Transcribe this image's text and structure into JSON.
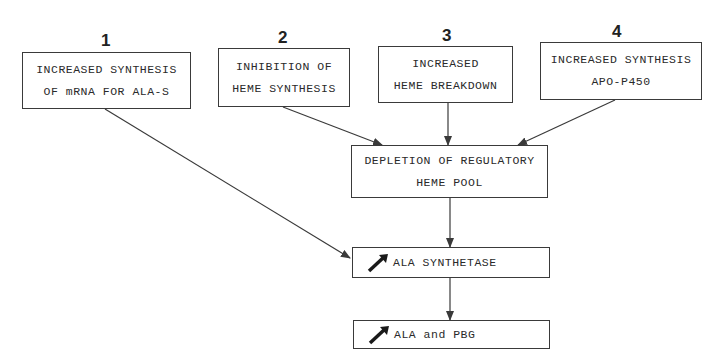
{
  "diagram": {
    "causes": [
      {
        "number": "1",
        "lines": [
          "INCREASED SYNTHESIS",
          "OF mRNA FOR ALA-S"
        ]
      },
      {
        "number": "2",
        "lines": [
          "INHIBITION OF",
          "HEME SYNTHESIS"
        ]
      },
      {
        "number": "3",
        "lines": [
          "INCREASED",
          "HEME BREAKDOWN"
        ]
      },
      {
        "number": "4",
        "lines": [
          "INCREASED SYNTHESIS",
          "APO-P450"
        ]
      }
    ],
    "depletion": {
      "lines": [
        "DEPLETION OF REGULATORY",
        "HEME POOL"
      ]
    },
    "ala_synthetase": {
      "icon": "increase-arrow-icon",
      "label": "ALA SYNTHETASE"
    },
    "ala_pbg": {
      "icon": "increase-arrow-icon",
      "label": "ALA and PBG"
    }
  },
  "colors": {
    "line": "#3a3a3a",
    "background": "#ffffff"
  }
}
